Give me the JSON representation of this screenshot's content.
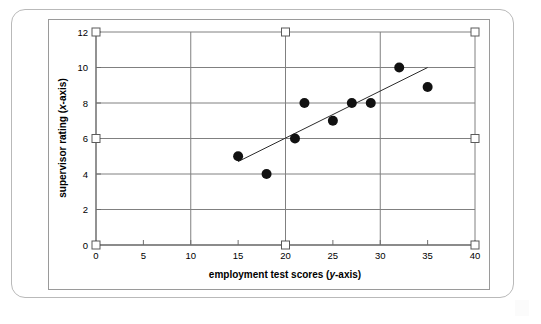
{
  "chart_data": {
    "type": "scatter",
    "title": "",
    "xlabel": "employment test scores (y-axis)",
    "xlabel_prefix": "employment test scores (",
    "xlabel_italic": "y",
    "xlabel_suffix": "-axis)",
    "ylabel": "supervisor rating (x-axis)",
    "ylabel_prefix": "supervisor rating (",
    "ylabel_italic": "x",
    "ylabel_suffix": "-axis)",
    "xlim": [
      0,
      40
    ],
    "ylim": [
      0,
      12
    ],
    "xticks": [
      0,
      5,
      10,
      15,
      20,
      25,
      30,
      35,
      40
    ],
    "yticks": [
      0,
      2,
      4,
      6,
      8,
      10,
      12
    ],
    "xtick_labels": [
      "0",
      "5",
      "10",
      "15",
      "20",
      "25",
      "30",
      "35",
      "40"
    ],
    "ytick_labels": [
      "0",
      "2",
      "4",
      "6",
      "8",
      "10",
      "12"
    ],
    "grid": true,
    "grid_x_values": [
      0,
      10,
      20,
      30,
      40
    ],
    "grid_y_values": [
      0,
      2,
      4,
      6,
      8,
      10,
      12
    ],
    "legend": null,
    "points": [
      {
        "x": 15,
        "y": 5
      },
      {
        "x": 18,
        "y": 4
      },
      {
        "x": 21,
        "y": 6
      },
      {
        "x": 22,
        "y": 8
      },
      {
        "x": 25,
        "y": 7
      },
      {
        "x": 27,
        "y": 8
      },
      {
        "x": 29,
        "y": 8
      },
      {
        "x": 32,
        "y": 10
      },
      {
        "x": 35,
        "y": 8.9
      }
    ],
    "series": [
      {
        "name": "observations",
        "marker": "filled-circle",
        "color": "#111111",
        "x": [
          15,
          18,
          21,
          22,
          25,
          27,
          29,
          32,
          35
        ],
        "values": [
          5,
          4,
          6,
          8,
          7,
          8,
          8,
          10,
          8.9
        ]
      }
    ],
    "trendline": {
      "name": "line of best fit",
      "color": "#2b2b2b",
      "x_start": 15,
      "y_start": 4.7,
      "x_end": 35,
      "y_end": 10.0
    },
    "selection_handles": [
      {
        "x": 0,
        "y": 12
      },
      {
        "x": 20,
        "y": 12
      },
      {
        "x": 40,
        "y": 12
      },
      {
        "x": 0,
        "y": 6
      },
      {
        "x": 40,
        "y": 6
      },
      {
        "x": 0,
        "y": 0
      },
      {
        "x": 20,
        "y": 0
      },
      {
        "x": 40,
        "y": 0
      }
    ]
  },
  "colors": {
    "outer_frame": "#b9b9b9",
    "chart_frame": "#9a9a9a",
    "gridline": "#808080",
    "axis": "#7a7a7a",
    "point": "#111111",
    "trendline": "#2b2b2b",
    "handle_fill": "#ffffff",
    "handle_stroke": "#5a5a5a",
    "background": "#ffffff"
  }
}
